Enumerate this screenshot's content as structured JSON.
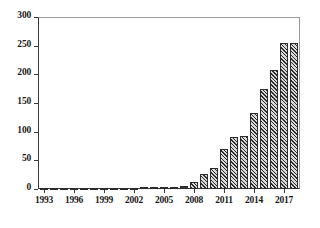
{
  "chart_data": {
    "type": "bar",
    "title": "",
    "xlabel": "",
    "ylabel": "",
    "ylim": [
      0,
      300
    ],
    "xlim": [
      1992.4,
      2018.6
    ],
    "grid": false,
    "legend": null,
    "y_ticks": [
      0,
      50,
      100,
      150,
      200,
      250,
      300
    ],
    "y_tick_labels": [
      "0",
      "50",
      "100",
      "150",
      "200",
      "250",
      "300"
    ],
    "x_ticks": [
      1993,
      1996,
      1999,
      2002,
      2005,
      2008,
      2011,
      2014,
      2017
    ],
    "x_tick_labels": [
      "1993",
      "1996",
      "1999",
      "2002",
      "2005",
      "2008",
      "2011",
      "2014",
      "2017"
    ],
    "categories": [
      "1993",
      "1994",
      "1995",
      "1996",
      "1997",
      "1998",
      "1999",
      "2000",
      "2001",
      "2002",
      "2003",
      "2004",
      "2005",
      "2006",
      "2007",
      "2008",
      "2009",
      "2010",
      "2011",
      "2012",
      "2013",
      "2014",
      "2015",
      "2016",
      "2017",
      "2018"
    ],
    "values": [
      1,
      0,
      1,
      1,
      1,
      0,
      1,
      2,
      2,
      2,
      3,
      3,
      3,
      4,
      5,
      12,
      26,
      37,
      70,
      90,
      92,
      133,
      175,
      208,
      255,
      255
    ],
    "bar_color": "#5b5b5b",
    "bar_edge_color": "#2b2b2b",
    "bar_hatch": "diagonal-lines"
  }
}
